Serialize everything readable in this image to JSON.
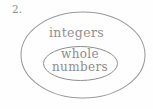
{
  "figure": {
    "item_number": "2.",
    "background_color": "#fefefe",
    "stroke_color": "#9a9a9a",
    "text_color": "#8c8c8c",
    "outer_set": {
      "label": "integers",
      "shape": "ellipse"
    },
    "inner_set": {
      "label_line1": "whole",
      "label_line2": "numbers",
      "full_label": "whole numbers",
      "shape": "ellipse"
    }
  }
}
